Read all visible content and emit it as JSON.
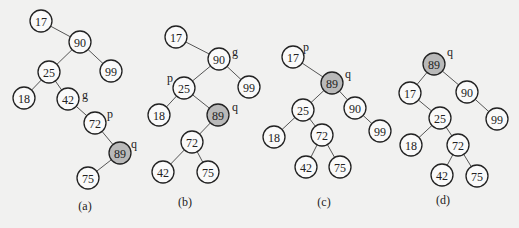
{
  "diagram": {
    "colors": {
      "highlight": "#b9b9b9",
      "node_fill": "#fafafa",
      "stroke": "#222222",
      "background": "#f1f1f0"
    },
    "panels": [
      {
        "caption": "(a)",
        "caption_pos": [
          85,
          210
        ],
        "nodes": [
          {
            "id": "17",
            "label": "17",
            "x": 41,
            "y": 21
          },
          {
            "id": "90",
            "label": "90",
            "x": 80,
            "y": 42
          },
          {
            "id": "99",
            "label": "99",
            "x": 111,
            "y": 71
          },
          {
            "id": "25",
            "label": "25",
            "x": 49,
            "y": 72
          },
          {
            "id": "18",
            "label": "18",
            "x": 24,
            "y": 98
          },
          {
            "id": "42",
            "label": "42",
            "x": 68,
            "y": 99
          },
          {
            "id": "72",
            "label": "72",
            "x": 95,
            "y": 123
          },
          {
            "id": "89",
            "label": "89",
            "x": 120,
            "y": 153,
            "highlight": true
          },
          {
            "id": "75",
            "label": "75",
            "x": 88,
            "y": 178
          }
        ],
        "edges": [
          [
            "17",
            "90"
          ],
          [
            "90",
            "25"
          ],
          [
            "90",
            "99"
          ],
          [
            "25",
            "18"
          ],
          [
            "25",
            "42"
          ],
          [
            "42",
            "72"
          ],
          [
            "72",
            "89"
          ],
          [
            "89",
            "75"
          ]
        ],
        "pointers": [
          {
            "label": "g",
            "x": 82,
            "y": 99
          },
          {
            "label": "p",
            "x": 107,
            "y": 118
          },
          {
            "label": "q",
            "x": 131,
            "y": 148
          }
        ]
      },
      {
        "caption": "(b)",
        "caption_pos": [
          185,
          206
        ],
        "nodes": [
          {
            "id": "17",
            "label": "17",
            "x": 176,
            "y": 37
          },
          {
            "id": "90",
            "label": "90",
            "x": 219,
            "y": 59
          },
          {
            "id": "99",
            "label": "99",
            "x": 249,
            "y": 87
          },
          {
            "id": "25",
            "label": "25",
            "x": 184,
            "y": 88
          },
          {
            "id": "18",
            "label": "18",
            "x": 159,
            "y": 115
          },
          {
            "id": "89",
            "label": "89",
            "x": 218,
            "y": 115,
            "highlight": true
          },
          {
            "id": "72",
            "label": "72",
            "x": 192,
            "y": 142
          },
          {
            "id": "42",
            "label": "42",
            "x": 163,
            "y": 172
          },
          {
            "id": "75",
            "label": "75",
            "x": 208,
            "y": 172
          }
        ],
        "edges": [
          [
            "17",
            "90"
          ],
          [
            "90",
            "25"
          ],
          [
            "90",
            "99"
          ],
          [
            "25",
            "18"
          ],
          [
            "25",
            "89"
          ],
          [
            "89",
            "72"
          ],
          [
            "72",
            "42"
          ],
          [
            "72",
            "75"
          ]
        ],
        "pointers": [
          {
            "label": "g",
            "x": 232,
            "y": 56
          },
          {
            "label": "p",
            "x": 167,
            "y": 82
          },
          {
            "label": "q",
            "x": 232,
            "y": 111
          }
        ]
      },
      {
        "caption": "(c)",
        "caption_pos": [
          324,
          206
        ],
        "nodes": [
          {
            "id": "17",
            "label": "17",
            "x": 293,
            "y": 57
          },
          {
            "id": "89",
            "label": "89",
            "x": 332,
            "y": 83,
            "highlight": true
          },
          {
            "id": "25",
            "label": "25",
            "x": 303,
            "y": 110
          },
          {
            "id": "90",
            "label": "90",
            "x": 355,
            "y": 108
          },
          {
            "id": "18",
            "label": "18",
            "x": 274,
            "y": 137
          },
          {
            "id": "72",
            "label": "72",
            "x": 322,
            "y": 135
          },
          {
            "id": "99",
            "label": "99",
            "x": 380,
            "y": 131
          },
          {
            "id": "42",
            "label": "42",
            "x": 306,
            "y": 167
          },
          {
            "id": "75",
            "label": "75",
            "x": 340,
            "y": 167
          }
        ],
        "edges": [
          [
            "17",
            "89"
          ],
          [
            "89",
            "25"
          ],
          [
            "89",
            "90"
          ],
          [
            "25",
            "18"
          ],
          [
            "25",
            "72"
          ],
          [
            "90",
            "99"
          ],
          [
            "72",
            "42"
          ],
          [
            "72",
            "75"
          ]
        ],
        "pointers": [
          {
            "label": "p",
            "x": 303,
            "y": 51
          },
          {
            "label": "q",
            "x": 345,
            "y": 78
          }
        ]
      },
      {
        "caption": "(d)",
        "caption_pos": [
          443,
          204
        ],
        "nodes": [
          {
            "id": "89",
            "label": "89",
            "x": 434,
            "y": 64,
            "highlight": true
          },
          {
            "id": "17",
            "label": "17",
            "x": 410,
            "y": 93
          },
          {
            "id": "90",
            "label": "90",
            "x": 467,
            "y": 92
          },
          {
            "id": "25",
            "label": "25",
            "x": 440,
            "y": 118
          },
          {
            "id": "99",
            "label": "99",
            "x": 497,
            "y": 119
          },
          {
            "id": "18",
            "label": "18",
            "x": 411,
            "y": 145
          },
          {
            "id": "72",
            "label": "72",
            "x": 458,
            "y": 145
          },
          {
            "id": "42",
            "label": "42",
            "x": 442,
            "y": 175
          },
          {
            "id": "75",
            "label": "75",
            "x": 477,
            "y": 176
          }
        ],
        "edges": [
          [
            "89",
            "17"
          ],
          [
            "89",
            "90"
          ],
          [
            "17",
            "25"
          ],
          [
            "90",
            "99"
          ],
          [
            "25",
            "18"
          ],
          [
            "25",
            "72"
          ],
          [
            "72",
            "42"
          ],
          [
            "72",
            "75"
          ]
        ],
        "pointers": [
          {
            "label": "q",
            "x": 447,
            "y": 56
          }
        ]
      }
    ]
  }
}
